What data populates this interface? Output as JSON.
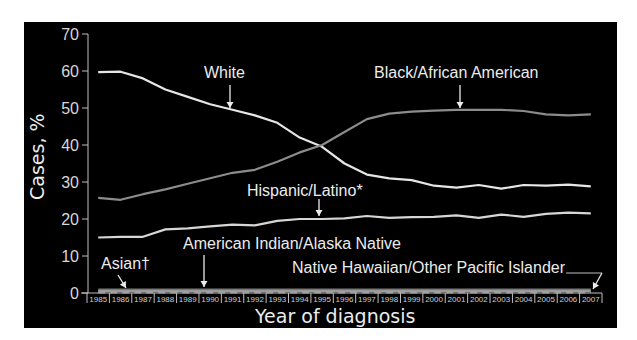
{
  "chart_data": {
    "type": "line",
    "title": "",
    "xlabel": "Year of diagnosis",
    "ylabel": "Cases, %",
    "ylim": [
      0,
      70
    ],
    "yticks": [
      0,
      10,
      20,
      30,
      40,
      50,
      60,
      70
    ],
    "grid": false,
    "legend_position": "inline labels with arrows",
    "x": [
      "1985",
      "1986",
      "1987",
      "1988",
      "1989",
      "1990",
      "1991",
      "1992",
      "1993",
      "1994",
      "1995",
      "1996",
      "1997",
      "1998",
      "1999",
      "2000",
      "2001",
      "2002",
      "2003",
      "2004",
      "2005",
      "2006",
      "2007"
    ],
    "series": [
      {
        "name": "White",
        "color": "#e6e6e6",
        "style": "solid",
        "values": [
          59.7,
          59.8,
          58.0,
          55.0,
          53.0,
          51.0,
          49.5,
          48.0,
          46.0,
          42.0,
          39.5,
          35.0,
          32.0,
          31.0,
          30.5,
          29.0,
          28.5,
          29.2,
          28.2,
          29.2,
          29.0,
          29.3,
          28.8
        ]
      },
      {
        "name": "Black/African American",
        "color": "#8c8c8c",
        "style": "solid",
        "values": [
          25.7,
          25.2,
          26.7,
          28.0,
          29.5,
          31.0,
          32.5,
          33.3,
          35.5,
          38.0,
          40.0,
          43.5,
          47.0,
          48.5,
          49.0,
          49.3,
          49.5,
          49.5,
          49.5,
          49.2,
          48.3,
          48.0,
          48.3
        ]
      },
      {
        "name": "Hispanic/Latino*",
        "color": "#d6d6d6",
        "style": "solid",
        "values": [
          15.0,
          15.2,
          15.2,
          17.2,
          17.5,
          18.0,
          18.5,
          18.3,
          19.5,
          20.0,
          20.0,
          20.2,
          20.8,
          20.3,
          20.5,
          20.6,
          21.0,
          20.3,
          21.2,
          20.6,
          21.4,
          21.7,
          21.5
        ]
      },
      {
        "name": "Asian†",
        "color": "#777777",
        "style": "solid",
        "values": [
          0.9,
          0.9,
          0.9,
          0.9,
          0.9,
          0.9,
          0.9,
          0.9,
          0.9,
          0.9,
          0.9,
          0.9,
          0.9,
          0.9,
          0.9,
          0.9,
          0.9,
          0.9,
          0.9,
          0.9,
          0.9,
          0.9,
          0.9
        ]
      },
      {
        "name": "American Indian/Alaska Native",
        "color": "#9a9a9a",
        "style": "solid",
        "values": [
          0.5,
          0.5,
          0.5,
          0.5,
          0.5,
          0.5,
          0.5,
          0.5,
          0.5,
          0.5,
          0.5,
          0.5,
          0.5,
          0.5,
          0.5,
          0.5,
          0.5,
          0.5,
          0.5,
          0.5,
          0.5,
          0.5,
          0.5
        ]
      },
      {
        "name": "Native Hawaiian/Other Pacific Islander",
        "color": "#a0a0a0",
        "style": "dashed",
        "values": [
          0.2,
          0.2,
          0.2,
          0.2,
          0.2,
          0.2,
          0.2,
          0.2,
          0.2,
          0.2,
          0.2,
          0.2,
          0.2,
          0.2,
          0.2,
          0.2,
          0.2,
          0.2,
          0.2,
          0.2,
          0.2,
          0.2,
          0.2
        ]
      }
    ],
    "annotations": [
      {
        "text": "White",
        "arrow_to_year": "1992"
      },
      {
        "text": "Black/African American",
        "arrow_to_year": "2002"
      },
      {
        "text": "Hispanic/Latino*",
        "arrow_to_year": "1995"
      },
      {
        "text": "Asian†",
        "arrow_to_year": "1986"
      },
      {
        "text": "American Indian/Alaska Native",
        "arrow_to_year": "1990"
      },
      {
        "text": "Native Hawaiian/Other Pacific Islander",
        "arrow_to_year": "2007"
      }
    ]
  },
  "labels": {
    "white": "White",
    "black": "Black/African American",
    "hispanic": "Hispanic/Latino*",
    "asian": "Asian†",
    "aian": "American Indian/Alaska Native",
    "nhopi": "Native Hawaiian/Other Pacific Islander",
    "xlabel": "Year of diagnosis",
    "ylabel": "Cases, %"
  },
  "colors": {
    "background": "#000000",
    "axis": "#bfbfbf",
    "text": "#ececec"
  }
}
